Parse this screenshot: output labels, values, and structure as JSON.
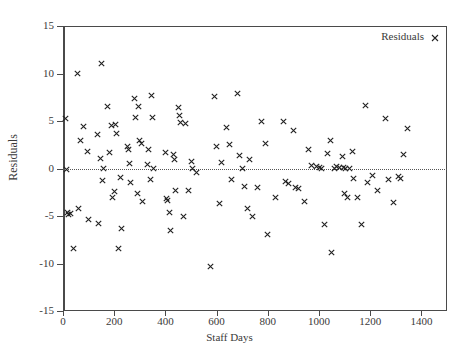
{
  "chart_data": {
    "type": "scatter",
    "title": "",
    "xlabel": "Staff Days",
    "ylabel": "Residuals",
    "xlim": [
      0,
      1500
    ],
    "ylim": [
      -15,
      15
    ],
    "xticks": [
      0,
      200,
      400,
      600,
      800,
      1000,
      1200,
      1400
    ],
    "yticks": [
      -15,
      -10,
      -5,
      0,
      5,
      10,
      15
    ],
    "grid": false,
    "reference_line": {
      "y": 0,
      "style": "dotted"
    },
    "legend": {
      "position": "top-right",
      "entries": [
        {
          "name": "Residuals",
          "marker": "x"
        }
      ]
    },
    "series": [
      {
        "name": "Residuals",
        "marker": "x",
        "color": "#222222",
        "points": [
          [
            10,
            5.3
          ],
          [
            14,
            -0.1
          ],
          [
            18,
            -4.6
          ],
          [
            22,
            -4.8
          ],
          [
            30,
            -4.7
          ],
          [
            40,
            -8.4
          ],
          [
            55,
            10.0
          ],
          [
            62,
            -4.2
          ],
          [
            70,
            2.9
          ],
          [
            80,
            4.4
          ],
          [
            95,
            1.8
          ],
          [
            100,
            -5.4
          ],
          [
            135,
            3.6
          ],
          [
            140,
            -5.8
          ],
          [
            145,
            1.1
          ],
          [
            150,
            11.1
          ],
          [
            155,
            -1.3
          ],
          [
            160,
            0.0
          ],
          [
            175,
            6.5
          ],
          [
            180,
            1.7
          ],
          [
            190,
            4.5
          ],
          [
            195,
            -3.0
          ],
          [
            200,
            -2.4
          ],
          [
            205,
            4.6
          ],
          [
            210,
            3.7
          ],
          [
            215,
            -8.4
          ],
          [
            225,
            -0.9
          ],
          [
            230,
            -6.3
          ],
          [
            250,
            2.3
          ],
          [
            255,
            2.0
          ],
          [
            260,
            0.5
          ],
          [
            265,
            -1.5
          ],
          [
            280,
            7.4
          ],
          [
            285,
            5.4
          ],
          [
            290,
            -2.6
          ],
          [
            295,
            6.5
          ],
          [
            300,
            2.9
          ],
          [
            305,
            2.6
          ],
          [
            310,
            -3.5
          ],
          [
            330,
            0.4
          ],
          [
            335,
            2.0
          ],
          [
            340,
            -1.2
          ],
          [
            345,
            7.7
          ],
          [
            350,
            5.4
          ],
          [
            355,
            0.0
          ],
          [
            400,
            1.7
          ],
          [
            405,
            -3.2
          ],
          [
            410,
            -3.4
          ],
          [
            415,
            -4.6
          ],
          [
            420,
            -6.5
          ],
          [
            430,
            1.5
          ],
          [
            435,
            1.0
          ],
          [
            440,
            -2.3
          ],
          [
            450,
            6.4
          ],
          [
            455,
            5.6
          ],
          [
            460,
            4.8
          ],
          [
            470,
            -5.0
          ],
          [
            480,
            4.7
          ],
          [
            490,
            -2.3
          ],
          [
            500,
            0.7
          ],
          [
            505,
            0.0
          ],
          [
            520,
            -0.4
          ],
          [
            575,
            -10.3
          ],
          [
            590,
            7.6
          ],
          [
            600,
            2.3
          ],
          [
            610,
            -3.7
          ],
          [
            620,
            0.6
          ],
          [
            640,
            4.3
          ],
          [
            650,
            2.5
          ],
          [
            660,
            -1.2
          ],
          [
            680,
            7.9
          ],
          [
            690,
            1.4
          ],
          [
            700,
            0.0
          ],
          [
            710,
            -1.9
          ],
          [
            720,
            -4.2
          ],
          [
            730,
            1.0
          ],
          [
            740,
            -5.0
          ],
          [
            760,
            -2.0
          ],
          [
            775,
            4.9
          ],
          [
            790,
            2.6
          ],
          [
            800,
            -6.9
          ],
          [
            830,
            -3.0
          ],
          [
            860,
            5.0
          ],
          [
            870,
            -1.4
          ],
          [
            880,
            -1.6
          ],
          [
            900,
            4.0
          ],
          [
            910,
            -2.0
          ],
          [
            920,
            -2.1
          ],
          [
            945,
            -3.5
          ],
          [
            960,
            2.0
          ],
          [
            970,
            0.3
          ],
          [
            990,
            0.2
          ],
          [
            1000,
            0.1
          ],
          [
            1010,
            0.0
          ],
          [
            1020,
            -5.9
          ],
          [
            1035,
            1.6
          ],
          [
            1045,
            2.9
          ],
          [
            1050,
            -8.8
          ],
          [
            1060,
            0.0
          ],
          [
            1070,
            0.2
          ],
          [
            1080,
            0.1
          ],
          [
            1090,
            1.3
          ],
          [
            1095,
            0.1
          ],
          [
            1100,
            -2.6
          ],
          [
            1105,
            0.0
          ],
          [
            1110,
            -3.0
          ],
          [
            1120,
            0.0
          ],
          [
            1130,
            1.8
          ],
          [
            1135,
            -1.0
          ],
          [
            1150,
            -3.0
          ],
          [
            1165,
            -5.9
          ],
          [
            1180,
            6.6
          ],
          [
            1190,
            -1.5
          ],
          [
            1210,
            -0.7
          ],
          [
            1230,
            -2.3
          ],
          [
            1260,
            5.3
          ],
          [
            1270,
            -1.2
          ],
          [
            1290,
            -3.6
          ],
          [
            1310,
            -0.8
          ],
          [
            1320,
            -1.1
          ],
          [
            1330,
            1.5
          ],
          [
            1345,
            4.2
          ]
        ]
      }
    ]
  },
  "legend": {
    "label": "Residuals"
  },
  "axes": {
    "x_label": "Staff Days",
    "y_label": "Residuals",
    "x_tick_labels": [
      "0",
      "200",
      "400",
      "600",
      "800",
      "1000",
      "1200",
      "1400"
    ],
    "y_tick_labels": [
      "15",
      "10",
      "5",
      "0",
      "-5",
      "-10",
      "-15"
    ]
  }
}
